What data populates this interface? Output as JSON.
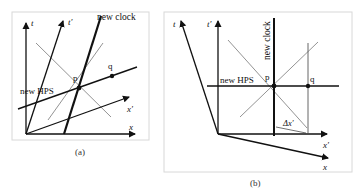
{
  "panels": [
    {
      "id": "a",
      "caption": "(a)",
      "labels": {
        "t": "t",
        "t_prime": "t′",
        "x": "x",
        "x_prime": "x′",
        "new_clock": "new clock",
        "new_hps": "new HPS",
        "p": "p",
        "q": "q"
      }
    },
    {
      "id": "b",
      "caption": "(b)",
      "labels": {
        "t": "t",
        "t_prime": "t′",
        "x": "x",
        "x_prime": "x′",
        "new_clock": "new clock",
        "new_hps": "new HPS",
        "p": "p",
        "q": "q",
        "delta_x_prime": "Δx′"
      }
    }
  ],
  "colors": {
    "frame": "#d8d8d8",
    "axis": "#111111",
    "light_line": "#777777"
  }
}
